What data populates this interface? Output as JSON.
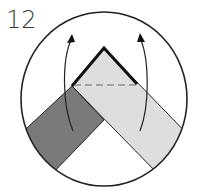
{
  "step": {
    "number": "12"
  },
  "diagram": {
    "colors": {
      "background": "#ffffff",
      "circle_stroke": "#222222",
      "dark_strip": "#7a7a7a",
      "light_strip": "#dedede",
      "thick_edge": "#111111",
      "dashed_line": "#666666",
      "arrow": "#222222"
    },
    "elements": {
      "circle": {
        "cx": 104,
        "cy": 99,
        "rx": 83,
        "ry": 87
      },
      "fold_line": {
        "type": "valley",
        "style": "dashed"
      },
      "arrows": [
        {
          "name": "left-fold-arrow",
          "direction": "up"
        },
        {
          "name": "right-fold-arrow",
          "direction": "up"
        }
      ]
    }
  }
}
